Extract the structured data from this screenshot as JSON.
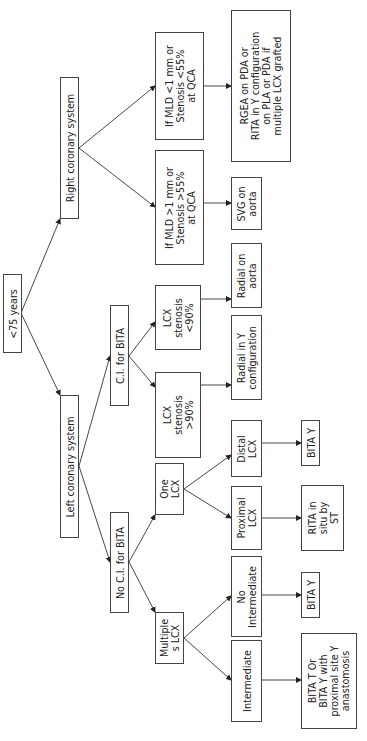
{
  "diagram": {
    "type": "flowchart",
    "orientation": "rotated 90° counter-clockwise (root at left edge, leaves toward right)",
    "nodes": {
      "root": "<75 years",
      "right_coronary": "Right coronary system",
      "left_coronary": "Left coronary system",
      "ci_bita": "C.I. for BITA",
      "no_ci_bita": "No C.I. for BITA",
      "mld_less": "If MLD <1 mm or\nStenosis <55%\nat QCA",
      "mld_more": "If MLD >1 mm or\nStenosis >55%\nat QCA",
      "lcx_lt90": "LCX\nstenosis\n<90%",
      "lcx_gt90": "LCX\nstenosis\n>90%",
      "one_lcx": "One\nLCX",
      "multiple_lcx": "Multiple\ns LCX",
      "rgea": "RGEA on PDA or\nRITA in Y configuration\non PLA or PDA if\nmultiple LCX grafted",
      "svg_aorta": "SVG on\naorta",
      "radial_aorta": "Radial on\naorta",
      "radial_y": "Radial in Y\nconfiguration",
      "distal_lcx": "Distal\nLCX",
      "proximal_lcx": "Proximal\nLCX",
      "no_intermediate": "No\nIntermediate",
      "intermediate": "Intermediate",
      "bita_y_distal": "BITA Y",
      "rita_in_situ": "RITA in\nsitu by\nST",
      "bita_y_noint": "BITA Y",
      "bita_t_or": "BITA T Or\nBITA Y with\nproximal site Y\nanastomosis"
    },
    "edges": [
      [
        "root",
        "right_coronary"
      ],
      [
        "root",
        "left_coronary"
      ],
      [
        "right_coronary",
        "mld_less"
      ],
      [
        "right_coronary",
        "mld_more"
      ],
      [
        "mld_less",
        "rgea"
      ],
      [
        "mld_more",
        "svg_aorta"
      ],
      [
        "left_coronary",
        "ci_bita"
      ],
      [
        "left_coronary",
        "no_ci_bita"
      ],
      [
        "ci_bita",
        "lcx_lt90"
      ],
      [
        "ci_bita",
        "lcx_gt90"
      ],
      [
        "lcx_lt90",
        "radial_aorta"
      ],
      [
        "lcx_gt90",
        "radial_y"
      ],
      [
        "no_ci_bita",
        "one_lcx"
      ],
      [
        "no_ci_bita",
        "multiple_lcx"
      ],
      [
        "one_lcx",
        "distal_lcx"
      ],
      [
        "one_lcx",
        "proximal_lcx"
      ],
      [
        "distal_lcx",
        "bita_y_distal"
      ],
      [
        "proximal_lcx",
        "rita_in_situ"
      ],
      [
        "multiple_lcx",
        "no_intermediate"
      ],
      [
        "multiple_lcx",
        "intermediate"
      ],
      [
        "no_intermediate",
        "bita_y_noint"
      ],
      [
        "intermediate",
        "bita_t_or"
      ]
    ],
    "colors": {
      "line": "#333333",
      "border": "#444444",
      "text": "#222222",
      "background": "#ffffff"
    }
  }
}
